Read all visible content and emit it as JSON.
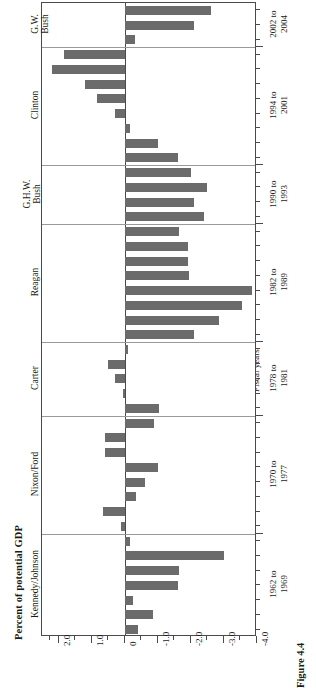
{
  "figure": {
    "caption": "Figure 4.4",
    "ylabel_left": "Percent of potential GDP",
    "xlabel_right": "Fiscal years"
  },
  "chart_data": {
    "type": "bar",
    "orientation": "horizontal",
    "title": "",
    "xlabel": "Percent of potential GDP",
    "ylabel": "Fiscal years",
    "xlim": [
      2.5,
      -4.0
    ],
    "xticks": [
      2.0,
      1.0,
      0,
      -1.0,
      -2.0,
      -3.0,
      -4.0
    ],
    "xticklabels": [
      "2.0",
      "1.0",
      "0",
      "-1.0",
      "-2.0",
      "-3.0",
      "-4.0"
    ],
    "grid": false,
    "legend": null,
    "bar_color": "#6b6b6b",
    "note": "Bars extend left for positive (surplus) and right for negative (deficit) values.",
    "groups": [
      {
        "president": "G.W. Bush",
        "period_line1": "2002 to",
        "period_line2": "2004",
        "values": [
          -2.6,
          -2.1,
          -0.3
        ]
      },
      {
        "president": "Clinton",
        "period_line1": "1994 to",
        "period_line2": "2001",
        "values": [
          1.85,
          2.2,
          1.2,
          0.85,
          0.3,
          -0.15,
          -1.0,
          -1.6
        ]
      },
      {
        "president": "G.H.W. Bush",
        "period_line1": "1990 to",
        "period_line2": "1993",
        "values": [
          -2.0,
          -2.5,
          -2.1,
          -2.4
        ]
      },
      {
        "president": "Reagan",
        "period_line1": "1982 to",
        "period_line2": "1989",
        "values": [
          -1.65,
          -1.9,
          -1.9,
          -1.95,
          -3.85,
          -3.55,
          -2.85,
          -2.1
        ]
      },
      {
        "president": "Carter",
        "period_line1": "1978 to",
        "period_line2": "1981",
        "values": [
          -0.1,
          0.5,
          0.3,
          0.05,
          -1.05
        ]
      },
      {
        "president": "Nixon/Ford",
        "period_line1": "1970 to",
        "period_line2": "1977",
        "values": [
          -0.9,
          0.6,
          0.6,
          -1.0,
          -0.6,
          -0.35,
          0.65,
          0.1
        ]
      },
      {
        "president": "Kennedy/Johnson",
        "period_line1": "1962 to",
        "period_line2": "1969",
        "values": [
          -0.15,
          -3.0,
          -1.65,
          -1.6,
          -0.25,
          -0.85,
          -0.4
        ]
      }
    ]
  }
}
